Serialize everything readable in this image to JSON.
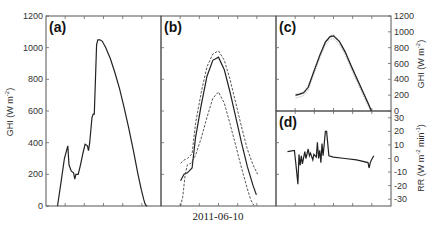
{
  "chart_data": [
    {
      "panel": "(a)",
      "type": "line",
      "title": "",
      "xlabel": "",
      "ylabel": "GHI (W m^-2)",
      "ylim": [
        0,
        1200
      ],
      "yticks": [
        0,
        200,
        400,
        600,
        800,
        1000,
        1200
      ],
      "series": [
        {
          "name": "GHI measured",
          "style": "solid",
          "x": [
            0.1,
            0.13,
            0.16,
            0.19,
            0.2,
            0.22,
            0.24,
            0.25,
            0.26,
            0.28,
            0.3,
            0.32,
            0.34,
            0.36,
            0.37,
            0.38,
            0.4,
            0.41,
            0.42,
            0.44,
            0.45,
            0.47,
            0.49,
            0.52,
            0.56,
            0.6,
            0.64,
            0.68,
            0.72,
            0.76,
            0.8,
            0.83,
            0.85,
            0.86,
            0.87,
            0.88
          ],
          "values": [
            0,
            150,
            300,
            380,
            260,
            220,
            210,
            170,
            200,
            200,
            260,
            330,
            390,
            380,
            350,
            400,
            560,
            580,
            580,
            1020,
            1050,
            1050,
            1040,
            1000,
            930,
            840,
            740,
            620,
            490,
            350,
            200,
            100,
            40,
            15,
            3,
            0
          ]
        }
      ]
    },
    {
      "panel": "(b)",
      "type": "line",
      "xlabel": "2011-06-10",
      "ylim": [
        0,
        1200
      ],
      "series": [
        {
          "name": "forecast",
          "style": "solid",
          "x": [
            0.17,
            0.2,
            0.23,
            0.27,
            0.3,
            0.35,
            0.4,
            0.45,
            0.5,
            0.55,
            0.6,
            0.65,
            0.7,
            0.75,
            0.8,
            0.83
          ],
          "values": [
            160,
            200,
            210,
            240,
            430,
            640,
            820,
            920,
            940,
            860,
            720,
            560,
            400,
            250,
            130,
            70
          ]
        },
        {
          "name": "upper bound",
          "style": "dashed",
          "x": [
            0.17,
            0.2,
            0.23,
            0.27,
            0.3,
            0.35,
            0.4,
            0.45,
            0.5,
            0.55,
            0.6,
            0.65,
            0.7,
            0.75,
            0.8,
            0.84
          ],
          "values": [
            270,
            290,
            300,
            330,
            520,
            720,
            880,
            960,
            980,
            920,
            800,
            650,
            500,
            360,
            260,
            200
          ]
        },
        {
          "name": "lower bound",
          "style": "dashed",
          "x": [
            0.17,
            0.19,
            0.21,
            0.23,
            0.26,
            0.3,
            0.35,
            0.4,
            0.45,
            0.5,
            0.55,
            0.6,
            0.65,
            0.7,
            0.75,
            0.78,
            0.8,
            0.82
          ],
          "values": [
            0,
            60,
            200,
            260,
            270,
            320,
            430,
            560,
            680,
            720,
            650,
            520,
            380,
            240,
            110,
            40,
            10,
            0
          ]
        }
      ]
    },
    {
      "panel": "(c)",
      "type": "line",
      "ylabel": "GHI (W m^-2)",
      "ylim": [
        0,
        1200
      ],
      "yticks": [
        0,
        200,
        400,
        600,
        800,
        1000,
        1200
      ],
      "yaxis_position": "right",
      "series": [
        {
          "name": "ensemble",
          "style": "fuzzy",
          "x": [
            0.17,
            0.2,
            0.24,
            0.28,
            0.33,
            0.38,
            0.43,
            0.47,
            0.5,
            0.55,
            0.6,
            0.65,
            0.7,
            0.75,
            0.8,
            0.83
          ],
          "values": [
            200,
            210,
            230,
            300,
            500,
            700,
            870,
            940,
            950,
            880,
            750,
            580,
            420,
            260,
            100,
            0
          ]
        }
      ]
    },
    {
      "panel": "(d)",
      "type": "line",
      "ylabel": "RR (W m^-2 min^-1)",
      "ylim": [
        -35,
        35
      ],
      "yticks": [
        -30,
        -20,
        -10,
        0,
        10,
        20,
        30
      ],
      "yaxis_position": "right",
      "series": [
        {
          "name": "ramp rate",
          "style": "solid",
          "x": [
            0.1,
            0.16,
            0.17,
            0.19,
            0.2,
            0.21,
            0.22,
            0.23,
            0.25,
            0.26,
            0.28,
            0.29,
            0.3,
            0.32,
            0.33,
            0.35,
            0.36,
            0.37,
            0.38,
            0.39,
            0.4,
            0.41,
            0.43,
            0.44,
            0.46,
            0.5,
            0.6,
            0.7,
            0.8,
            0.81,
            0.82,
            0.83,
            0.85
          ],
          "values": [
            5,
            6,
            -2,
            -19,
            3,
            -5,
            2,
            -4,
            5,
            0,
            7,
            2,
            4,
            -1,
            3,
            1,
            12,
            0,
            6,
            -3,
            11,
            2,
            20,
            20,
            2,
            1,
            0,
            -1,
            -3,
            -7,
            -3,
            -1,
            2
          ]
        }
      ]
    }
  ],
  "labels": {
    "a": "(a)",
    "b": "(b)",
    "c": "(c)",
    "d": "(d)",
    "date": "2011-06-10",
    "ylabel_left": "GHI (W m",
    "ylabel_c": "GHI (W m",
    "ylabel_d": "RR (W m",
    "ylabel_d_tail": " min",
    "sup_minus2": "-2",
    "sup_minus1": "-1"
  }
}
